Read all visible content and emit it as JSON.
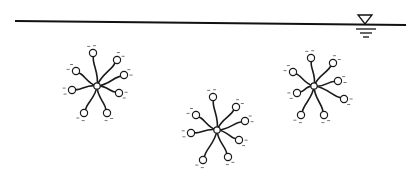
{
  "diagram": {
    "title": "",
    "colors": {
      "line": "#1a1a1a",
      "background": "#ffffff",
      "charge": "#555555"
    },
    "water_surface": {
      "x1": 15,
      "x2": 406,
      "y1": 21,
      "y2": 25,
      "symbol": "water-level-triangle"
    },
    "micelles": [
      {
        "id": "micelle-1",
        "center": [
          97,
          86
        ],
        "heads": [
          [
            93,
            53
          ],
          [
            117,
            60
          ],
          [
            124,
            75
          ],
          [
            119,
            93
          ],
          [
            107,
            113
          ],
          [
            84,
            113
          ],
          [
            72,
            90
          ],
          [
            76,
            71
          ]
        ]
      },
      {
        "id": "micelle-2",
        "center": [
          217,
          130
        ],
        "heads": [
          [
            213,
            97
          ],
          [
            236,
            107
          ],
          [
            245,
            121
          ],
          [
            239,
            140
          ],
          [
            228,
            157
          ],
          [
            203,
            160
          ],
          [
            191,
            133
          ],
          [
            196,
            115
          ]
        ]
      },
      {
        "id": "micelle-3",
        "center": [
          314,
          86
        ],
        "heads": [
          [
            311,
            58
          ],
          [
            333,
            63
          ],
          [
            338,
            81
          ],
          [
            344,
            99
          ],
          [
            324,
            115
          ],
          [
            301,
            115
          ],
          [
            297,
            93
          ],
          [
            293,
            72
          ]
        ]
      }
    ],
    "labels": []
  }
}
